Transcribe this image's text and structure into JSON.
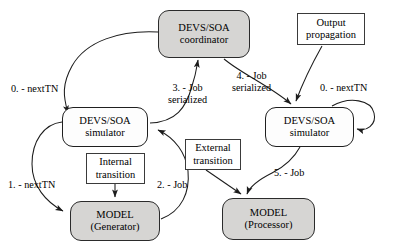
{
  "diagram": {
    "background": "#ffffff",
    "stroke_color": "#222222",
    "node_fill_gray": "#d6d5d3",
    "node_fill_white": "#ffffff",
    "nodes": [
      {
        "id": "coordinator",
        "shape": "rounded-rect",
        "fill": "gray",
        "line1": "DEVS/SOA",
        "line2": "coordinator",
        "x": 158,
        "y": 10,
        "w": 92,
        "h": 48
      },
      {
        "id": "output-propagation",
        "shape": "rect",
        "fill": "white",
        "line1": "Output",
        "line2": "propagation",
        "x": 297,
        "y": 13,
        "w": 68,
        "h": 32
      },
      {
        "id": "simulator-left",
        "shape": "rounded-rect",
        "fill": "white",
        "line1": "DEVS/SOA",
        "line2": "simulator",
        "x": 62,
        "y": 107,
        "w": 86,
        "h": 40
      },
      {
        "id": "simulator-right",
        "shape": "rounded-rect",
        "fill": "white",
        "line1": "DEVS/SOA",
        "line2": "simulator",
        "x": 265,
        "y": 107,
        "w": 89,
        "h": 40
      },
      {
        "id": "internal-transition",
        "shape": "rect",
        "fill": "white",
        "line1": "Internal",
        "line2": "transition",
        "x": 86,
        "y": 153,
        "w": 59,
        "h": 31
      },
      {
        "id": "external-transition",
        "shape": "rect",
        "fill": "white",
        "line1": "External",
        "line2": "transition",
        "x": 185,
        "y": 139,
        "w": 56,
        "h": 31
      },
      {
        "id": "model-generator",
        "shape": "rounded-rect",
        "fill": "gray",
        "line1": "MODEL",
        "line2": "(Generator)",
        "x": 70,
        "y": 201,
        "w": 90,
        "h": 40
      },
      {
        "id": "model-processor",
        "shape": "rounded-rect",
        "fill": "gray",
        "line1": "MODEL",
        "line2": "(Processor)",
        "x": 222,
        "y": 198,
        "w": 93,
        "h": 42
      }
    ],
    "edge_labels": [
      {
        "id": "label-0-nexttn-left",
        "line1": "0. - nextTN",
        "line2": "",
        "x": 11,
        "y": 83
      },
      {
        "id": "label-3-job-serialized",
        "line1": "3. - Job",
        "line2": "serialized",
        "x": 168,
        "y": 82
      },
      {
        "id": "label-4-job-serialized",
        "line1": "4. - Job",
        "line2": "serialized",
        "x": 232,
        "y": 70
      },
      {
        "id": "label-0-nexttn-right",
        "line1": "0. - nextTN",
        "line2": "",
        "x": 320,
        "y": 82
      },
      {
        "id": "label-1-nexttn",
        "line1": "1. - nextTN",
        "line2": "",
        "x": 8,
        "y": 179
      },
      {
        "id": "label-2-job",
        "line1": "2. - Job",
        "line2": "",
        "x": 157,
        "y": 179
      },
      {
        "id": "label-5-job",
        "line1": "5. - Job",
        "line2": "",
        "x": 274,
        "y": 167
      }
    ],
    "edges": [
      {
        "id": "edge-coordinator-to-simulator-left",
        "from": "coordinator",
        "to": "simulator-left",
        "label": "0. - nextTN"
      },
      {
        "id": "edge-simulator-left-to-coordinator",
        "from": "simulator-left",
        "to": "coordinator",
        "label": "3. - Job serialized"
      },
      {
        "id": "edge-coordinator-to-simulator-right",
        "from": "coordinator",
        "to": "simulator-right",
        "label": "4. - Job serialized"
      },
      {
        "id": "edge-output-propagation-to-simulator-right",
        "from": "output-propagation",
        "to": "simulator-right",
        "label": ""
      },
      {
        "id": "edge-simulator-right-self-nexttn",
        "from": "simulator-right",
        "to": "simulator-right",
        "label": "0. - nextTN"
      },
      {
        "id": "edge-simulator-left-to-model-generator",
        "from": "simulator-left",
        "to": "model-generator",
        "label": "1. - nextTN"
      },
      {
        "id": "edge-model-generator-to-simulator-left",
        "from": "model-generator",
        "to": "simulator-left",
        "label": "2. - Job"
      },
      {
        "id": "edge-internal-transition-to-model-generator",
        "from": "internal-transition",
        "to": "model-generator",
        "label": ""
      },
      {
        "id": "edge-external-transition-to-model-processor",
        "from": "external-transition",
        "to": "model-processor",
        "label": ""
      },
      {
        "id": "edge-simulator-right-to-model-processor",
        "from": "simulator-right",
        "to": "model-processor",
        "label": "5. - Job"
      }
    ]
  }
}
